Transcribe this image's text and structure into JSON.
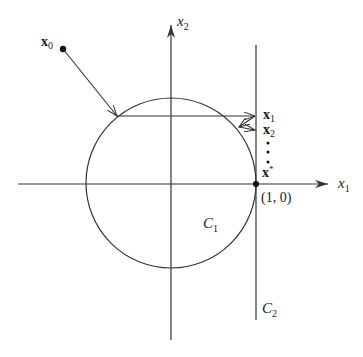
{
  "diagram": {
    "axes": {
      "x_label": "x",
      "x_sub": "1",
      "y_label": "x",
      "y_sub": "2"
    },
    "sets": {
      "circle_label": "C",
      "circle_sub": "1",
      "line_label": "C",
      "line_sub": "2"
    },
    "points": {
      "x0_label": "x",
      "x0_sub": "0",
      "x1_label": "x",
      "x1_sub": "1",
      "x2_label": "x",
      "x2_sub": "2",
      "xstar_label": "x",
      "xstar_sup": "*",
      "limit_coords": "(1, 0)"
    },
    "colors": {
      "stroke": "#333333",
      "background": "#ffffff"
    }
  }
}
